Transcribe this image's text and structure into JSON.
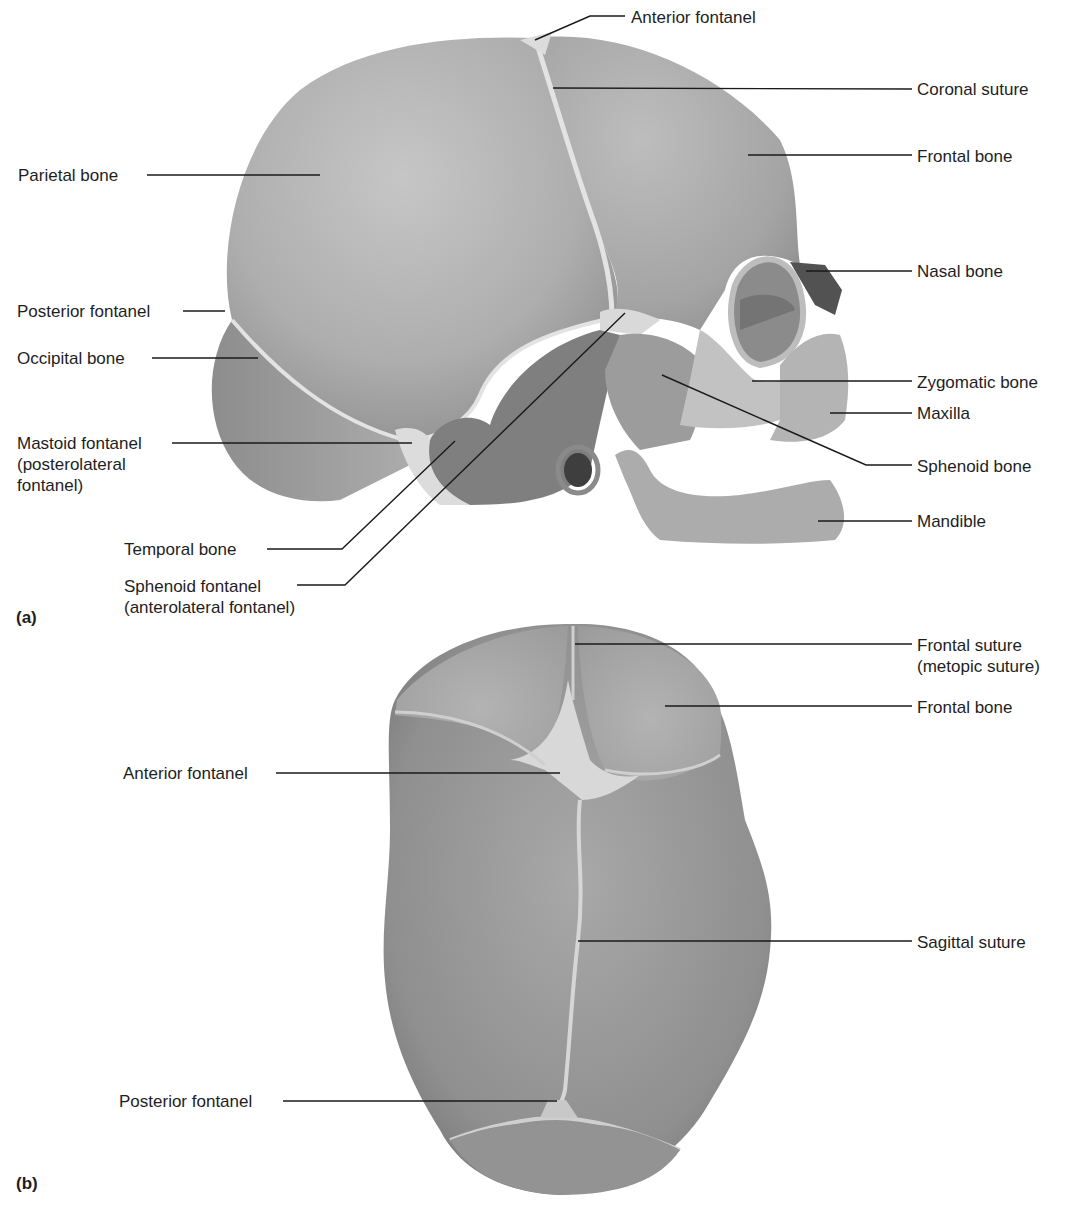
{
  "figure": {
    "panels": [
      {
        "id": "a",
        "letter": "(a)",
        "view": "lateral",
        "labels": [
          {
            "key": "anterior_fontanel",
            "text": "Anterior fontanel"
          },
          {
            "key": "coronal_suture",
            "text": "Coronal suture"
          },
          {
            "key": "parietal_bone",
            "text": "Parietal bone"
          },
          {
            "key": "frontal_bone",
            "text": "Frontal bone"
          },
          {
            "key": "nasal_bone",
            "text": "Nasal bone"
          },
          {
            "key": "posterior_fontanel",
            "text": "Posterior fontanel"
          },
          {
            "key": "occipital_bone",
            "text": "Occipital bone"
          },
          {
            "key": "zygomatic_bone",
            "text": "Zygomatic bone"
          },
          {
            "key": "maxilla",
            "text": "Maxilla"
          },
          {
            "key": "mastoid_fontanel",
            "lines": [
              "Mastoid fontanel",
              "(posterolateral",
              "fontanel)"
            ]
          },
          {
            "key": "sphenoid_bone",
            "text": "Sphenoid bone"
          },
          {
            "key": "mandible",
            "text": "Mandible"
          },
          {
            "key": "temporal_bone",
            "text": "Temporal bone"
          },
          {
            "key": "sphenoid_fontanel",
            "lines": [
              "Sphenoid fontanel",
              "(anterolateral fontanel)"
            ]
          }
        ]
      },
      {
        "id": "b",
        "letter": "(b)",
        "view": "superior",
        "labels": [
          {
            "key": "frontal_suture",
            "lines": [
              "Frontal suture",
              "(metopic suture)"
            ]
          },
          {
            "key": "frontal_bone",
            "text": "Frontal bone"
          },
          {
            "key": "anterior_fontanel",
            "text": "Anterior fontanel"
          },
          {
            "key": "sagittal_suture",
            "text": "Sagittal suture"
          },
          {
            "key": "posterior_fontanel",
            "text": "Posterior fontanel"
          }
        ]
      }
    ],
    "colors": {
      "background": "#ffffff",
      "bone": "#a9a9a9",
      "bone_light": "#c4c4c4",
      "bone_dark": "#6f6f6f",
      "fontanel": "#dedede",
      "leader_line": "#1a1a1a",
      "text": "#1e1e1e"
    }
  }
}
